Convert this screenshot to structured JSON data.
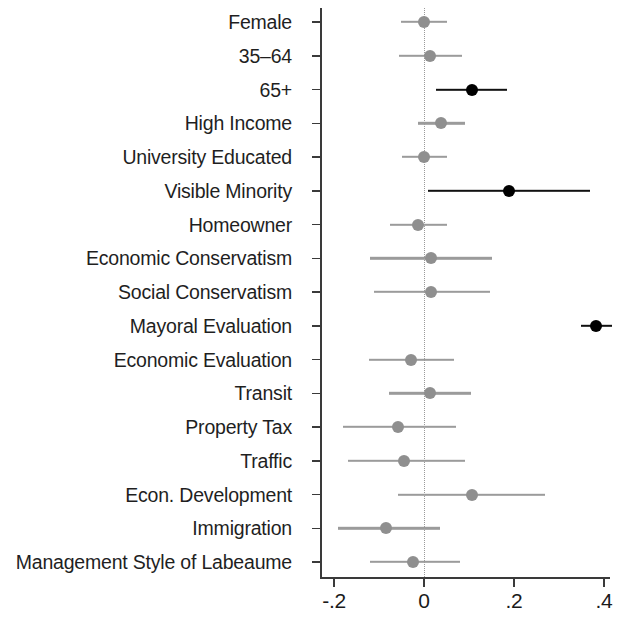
{
  "chart_data": {
    "type": "scatter",
    "subtype": "coefficient-plot",
    "title": "",
    "subtitle": "",
    "xlabel": "",
    "ylabel": "",
    "xlim": [
      -0.26,
      0.435
    ],
    "grid": false,
    "legend": null,
    "zero_reference_line": 0,
    "xticks": [
      -0.2,
      0,
      0.2,
      0.4
    ],
    "xticklabels": [
      "-.2",
      "0",
      ".2",
      ".4"
    ],
    "categories": [
      "Female",
      "35–64",
      "65+",
      "High Income",
      "University Educated",
      "Visible Minority",
      "Homeowner",
      "Economic Conservatism",
      "Social Conservatism",
      "Mayoral Evaluation",
      "Economic Evaluation",
      "Transit",
      "Property Tax",
      "Traffic",
      "Econ. Development",
      "Immigration",
      "Management Style of Labeaume"
    ],
    "values": [
      0.0,
      0.013,
      0.107,
      0.038,
      0.0,
      0.189,
      -0.013,
      0.016,
      0.016,
      0.382,
      -0.029,
      0.013,
      -0.058,
      -0.044,
      0.107,
      -0.084,
      -0.024
    ],
    "ci_low": [
      -0.051,
      -0.056,
      0.027,
      -0.013,
      -0.049,
      0.009,
      -0.076,
      -0.12,
      -0.111,
      0.349,
      -0.122,
      -0.078,
      -0.18,
      -0.169,
      -0.058,
      -0.191,
      -0.12
    ],
    "ci_high": [
      0.051,
      0.084,
      0.184,
      0.091,
      0.051,
      0.369,
      0.051,
      0.151,
      0.147,
      0.418,
      0.067,
      0.104,
      0.071,
      0.091,
      0.269,
      0.036,
      0.08
    ],
    "significant": [
      false,
      false,
      true,
      false,
      false,
      true,
      false,
      false,
      false,
      true,
      false,
      false,
      false,
      false,
      false,
      false,
      false
    ],
    "colors": {
      "significant": "#000000",
      "not_significant": "#8f8f8f",
      "axis": "#3a3a3a",
      "zero_line": "#9a9a9a",
      "background": "#ffffff"
    }
  }
}
